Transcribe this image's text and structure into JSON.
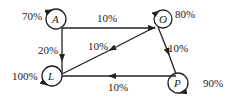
{
  "diagram": {
    "type": "state-transition",
    "nodes": [
      {
        "id": "A",
        "label": "A",
        "self_loop": "70%"
      },
      {
        "id": "O",
        "label": "O",
        "self_loop": "80%"
      },
      {
        "id": "L",
        "label": "L",
        "self_loop": "100%"
      },
      {
        "id": "P",
        "label": "P",
        "self_loop": "90%"
      }
    ],
    "edges": [
      {
        "from": "A",
        "to": "O",
        "label": "10%"
      },
      {
        "from": "A",
        "to": "L",
        "label": "20%"
      },
      {
        "from": "O",
        "to": "L",
        "label": "10%"
      },
      {
        "from": "O",
        "to": "P",
        "label": "10%"
      },
      {
        "from": "P",
        "to": "L",
        "label": "10%"
      }
    ],
    "colors": {
      "stroke": "#222222",
      "background": "#ffffff"
    }
  }
}
